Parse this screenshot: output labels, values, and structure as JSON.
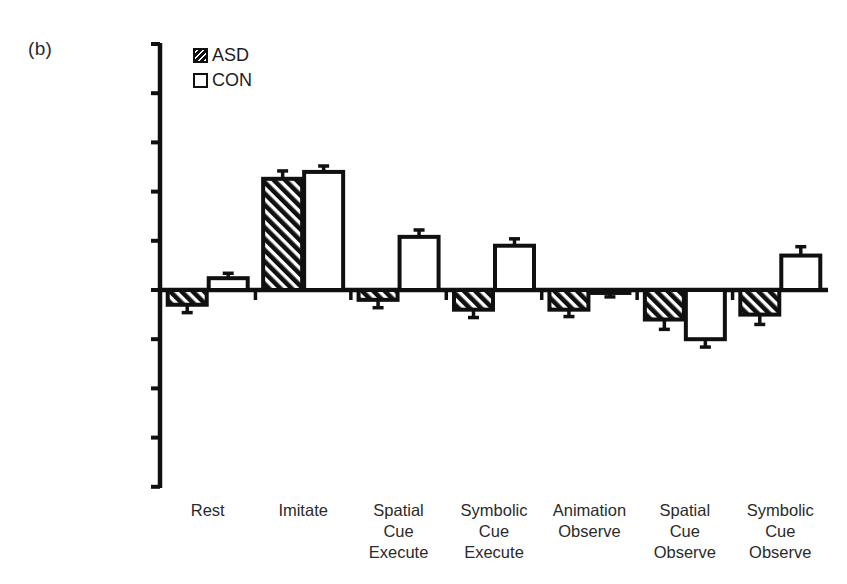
{
  "panel": {
    "label": "(b)"
  },
  "legend": {
    "position": "top-left-inside",
    "entries": [
      {
        "name": "ASD",
        "swatch": "hatched-black-diagonal"
      },
      {
        "name": "CON",
        "swatch": "white-outlined"
      }
    ]
  },
  "axis": {
    "y_ticks": [
      "0.25",
      "0.2",
      "0.15",
      "0.1",
      "0.05",
      "0",
      "-0.05",
      "-0.1",
      "-0.15",
      "-0.2"
    ],
    "y_tick_values": [
      0.25,
      0.2,
      0.15,
      0.1,
      0.05,
      0,
      -0.05,
      -0.1,
      -0.15,
      -0.2
    ],
    "x_tick_labels": [
      [
        "Rest"
      ],
      [
        "Imitate"
      ],
      [
        "Spatial",
        "Cue",
        "Execute"
      ],
      [
        "Symbolic",
        "Cue",
        "Execute"
      ],
      [
        "Animation",
        "Observe"
      ],
      [
        "Spatial",
        "Cue",
        "Observe"
      ],
      [
        "Symbolic",
        "Cue",
        "Observe"
      ]
    ]
  },
  "colors": {
    "axis": "#101010",
    "bar_outline": "#101010",
    "bar_fill_con": "#ffffff",
    "hatch": "#101010",
    "background": "#ffffff",
    "text": "#2a2a2a"
  },
  "chart_data": {
    "type": "bar",
    "title": "",
    "xlabel": "",
    "ylabel": "",
    "ylim": [
      -0.2,
      0.25
    ],
    "ytick_step": 0.05,
    "grid": false,
    "legend_position": "upper left",
    "orientation": "vertical",
    "error_bars": "symmetric SEM whiskers",
    "categories": [
      "Rest",
      "Imitate",
      "Spatial Cue Execute",
      "Symbolic Cue Execute",
      "Animation Observe",
      "Spatial Cue Observe",
      "Symbolic Cue Observe"
    ],
    "series": [
      {
        "name": "ASD",
        "style": "hatched",
        "values": [
          -0.015,
          0.113,
          -0.01,
          -0.02,
          -0.02,
          -0.03,
          -0.025
        ],
        "errors": [
          0.008,
          0.008,
          0.008,
          0.008,
          0.007,
          0.01,
          0.01
        ]
      },
      {
        "name": "CON",
        "style": "open",
        "values": [
          0.012,
          0.12,
          0.054,
          0.045,
          -0.003,
          -0.05,
          0.035
        ],
        "errors": [
          0.005,
          0.006,
          0.007,
          0.007,
          0.004,
          0.008,
          0.009
        ]
      }
    ]
  }
}
